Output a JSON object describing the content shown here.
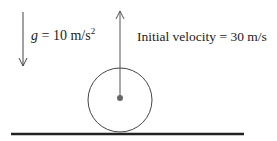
{
  "gravity": {
    "symbol": "g",
    "equals": " = 10 m/s",
    "exponent": "2"
  },
  "initial_velocity": {
    "text": "Initial velocity = 30 m/s"
  },
  "colors": {
    "stroke": "#333333",
    "ground": "#222222",
    "dot": "#555555"
  }
}
